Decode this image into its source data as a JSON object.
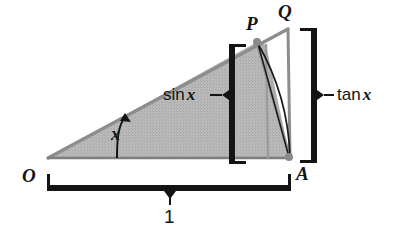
{
  "figure": {
    "colors": {
      "ink": "#141414",
      "fill_gray": "#b5b5b5",
      "line_gray": "#8d8d8d",
      "background": "#ffffff"
    }
  },
  "points": {
    "O": {
      "label": "O",
      "x": 48,
      "y": 158,
      "label_x": 22,
      "label_y": 166
    },
    "A": {
      "label": "A",
      "x": 290,
      "y": 158,
      "label_x": 296,
      "label_y": 164
    },
    "P": {
      "label": "P",
      "x": 257,
      "y": 42,
      "label_x": 246,
      "label_y": 14
    },
    "Q": {
      "label": "Q",
      "x": 288,
      "y": 29,
      "label_x": 278,
      "label_y": 2
    }
  },
  "annotations": {
    "angle": {
      "label": "x",
      "x": 111,
      "y": 125
    },
    "sin": {
      "prefix": "sin",
      "variable": "x",
      "x": 163,
      "y": 95
    },
    "tan": {
      "prefix": "tan",
      "variable": "x",
      "x": 321,
      "y": 86
    },
    "radius": {
      "label": "1",
      "x": 164,
      "y": 207
    }
  },
  "braces": {
    "sin_brace": {
      "name": "sin x measure brace",
      "x": 232,
      "y_top": 45,
      "y_bottom": 163,
      "tick_dir": "right",
      "notch_y": 95,
      "notch_dir": "left"
    },
    "tan_brace": {
      "name": "tan x measure brace",
      "x": 314,
      "y_top": 29,
      "y_bottom": 162,
      "tick_dir": "left",
      "notch_y": 95,
      "notch_dir": "right"
    },
    "unit_brace": {
      "name": "unit length brace",
      "y": 187,
      "x_left": 48,
      "x_right": 290,
      "tick_dir": "up",
      "notch_x": 170,
      "notch_dir": "down"
    }
  }
}
